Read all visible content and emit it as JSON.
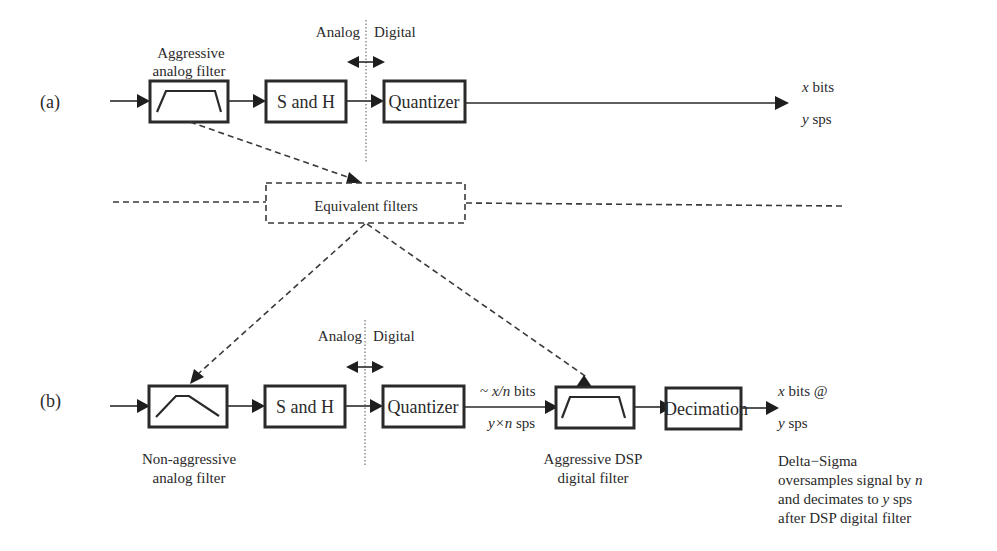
{
  "row_a": {
    "label": "(a)",
    "filter_caption_line1": "Aggressive",
    "filter_caption_line2": "analog filter",
    "boundary_analog": "Analog",
    "boundary_digital": "Digital",
    "sh_label": "S and H",
    "quantizer_label": "Quantizer",
    "output_bits_var": "x",
    "output_bits_unit": " bits",
    "output_rate_var": "y",
    "output_rate_unit": " sps"
  },
  "middle": {
    "equivalent_label": "Equivalent filters"
  },
  "row_b": {
    "label": "(b)",
    "filter_caption_line1": "Non-aggressive",
    "filter_caption_line2": "analog filter",
    "boundary_analog": "Analog",
    "boundary_digital": "Digital",
    "sh_label": "S and H",
    "quantizer_label": "Quantizer",
    "quant_bits_prefix": "~ ",
    "quant_bits_var": "x/n",
    "quant_bits_unit": " bits",
    "quant_rate_var": "y×n",
    "quant_rate_unit": " sps",
    "dsp_caption_line1": "Aggressive DSP",
    "dsp_caption_line2": "digital filter",
    "decimation_label": "Decimation",
    "output_bits_var": "x",
    "output_bits_unit": " bits @",
    "output_rate_var": "y",
    "output_rate_unit": " sps",
    "note_line1": "Delta−Sigma",
    "note_line2_text": "oversamples signal by ",
    "note_line2_var": "n",
    "note_line3_text": "and decimates to ",
    "note_line3_var": "y",
    "note_line3_unit": " sps",
    "note_line4": "after DSP digital filter"
  }
}
